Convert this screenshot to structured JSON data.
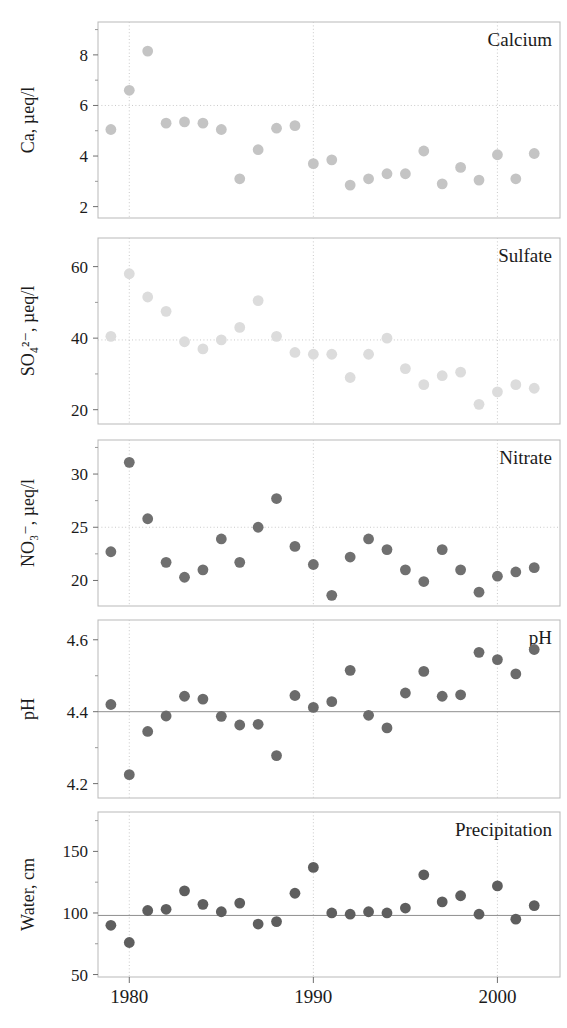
{
  "figure": {
    "width": 567,
    "height": 1028,
    "background": "#ffffff",
    "x_axis": {
      "tick_values": [
        1980,
        1990,
        2000
      ],
      "tick_labels": [
        "1980",
        "1990",
        "2000"
      ],
      "range": [
        1978.3,
        2003.4
      ],
      "gridlines": true
    },
    "colors": {
      "calcium_marker": "#c4c4c4",
      "sulfate_marker": "#dcdcdc",
      "nitrate_marker": "#707070",
      "ph_marker": "#6b6b6b",
      "water_marker": "#5e5e5e",
      "gridline_dotted": "#c9c9c9",
      "gridline_solid": "#8e8e8e",
      "frame": "#b9b9b9",
      "text": "#1b1b1b"
    }
  },
  "chart_data": [
    {
      "type": "scatter",
      "title": "Calcium",
      "xlabel": "",
      "ylabel": "Ca, µeq/l",
      "xlim": [
        1978.3,
        2003.4
      ],
      "ylim": [
        1.55,
        9.3
      ],
      "yticks": [
        2,
        4,
        6,
        8
      ],
      "ytick_labels": [
        "2",
        "4",
        "6",
        "8"
      ],
      "yminor_ticks": [
        3,
        5,
        7,
        9
      ],
      "gridlines_y": [
        6
      ],
      "grid": true,
      "marker_color": "#c4c4c4",
      "x": [
        1979,
        1980,
        1981,
        1982,
        1983,
        1984,
        1985,
        1986,
        1987,
        1988,
        1989,
        1990,
        1991,
        1992,
        1993,
        1994,
        1995,
        1996,
        1997,
        1998,
        1999,
        2000,
        2001,
        2002
      ],
      "values": [
        5.05,
        6.6,
        8.15,
        5.3,
        5.35,
        5.3,
        5.05,
        3.1,
        4.25,
        5.1,
        5.2,
        3.7,
        3.85,
        2.85,
        3.1,
        3.3,
        3.3,
        4.2,
        2.9,
        3.55,
        3.05,
        4.05,
        3.1,
        4.1
      ]
    },
    {
      "type": "scatter",
      "title": "Sulfate",
      "xlabel": "",
      "ylabel": "SO₄²⁻, µeq/l",
      "xlim": [
        1978.3,
        2003.4
      ],
      "ylim": [
        16,
        68
      ],
      "yticks": [
        20,
        40,
        60
      ],
      "ytick_labels": [
        "20",
        "40",
        "60"
      ],
      "yminor_ticks": [
        30,
        50
      ],
      "gridlines_y": [
        39.5
      ],
      "grid": true,
      "marker_color": "#dcdcdc",
      "x": [
        1979,
        1980,
        1981,
        1982,
        1983,
        1984,
        1985,
        1986,
        1987,
        1988,
        1989,
        1990,
        1991,
        1992,
        1993,
        1994,
        1995,
        1996,
        1997,
        1998,
        1999,
        2000,
        2001,
        2002
      ],
      "values": [
        40.5,
        58,
        51.5,
        47.5,
        39,
        37,
        39.5,
        43,
        50.5,
        40.5,
        36,
        35.5,
        35.5,
        29,
        35.5,
        40,
        31.5,
        27,
        29.5,
        30.5,
        21.5,
        25,
        27,
        26
      ]
    },
    {
      "type": "scatter",
      "title": "Nitrate",
      "xlabel": "",
      "ylabel": "NO₃⁻, µeq/l",
      "xlim": [
        1978.3,
        2003.4
      ],
      "ylim": [
        17.6,
        33.2
      ],
      "yticks": [
        20,
        25,
        30
      ],
      "ytick_labels": [
        "20",
        "25",
        "30"
      ],
      "yminor_ticks": [
        22.5,
        27.5,
        32.5
      ],
      "gridlines_y": [
        25
      ],
      "grid": true,
      "marker_color": "#707070",
      "x": [
        1979,
        1980,
        1981,
        1982,
        1983,
        1984,
        1985,
        1986,
        1987,
        1988,
        1989,
        1990,
        1991,
        1992,
        1993,
        1994,
        1995,
        1996,
        1997,
        1998,
        1999,
        2000,
        2001,
        2002
      ],
      "values": [
        22.7,
        31.1,
        25.8,
        21.7,
        20.3,
        21.0,
        23.9,
        21.7,
        25.0,
        27.7,
        23.2,
        21.5,
        18.6,
        22.2,
        23.9,
        22.9,
        21.0,
        19.9,
        22.9,
        21.0,
        18.9,
        20.4,
        20.8,
        21.2
      ]
    },
    {
      "type": "scatter",
      "title": "pH",
      "xlabel": "",
      "ylabel": "pH",
      "xlim": [
        1978.3,
        2003.4
      ],
      "ylim": [
        4.16,
        4.655
      ],
      "yticks": [
        4.2,
        4.4,
        4.6
      ],
      "ytick_labels": [
        "4.2",
        "4.4",
        "4.6"
      ],
      "yminor_ticks": [
        4.3,
        4.5
      ],
      "gridlines_y": [
        4.4
      ],
      "gridline_style": "solid",
      "grid": true,
      "marker_color": "#6b6b6b",
      "x": [
        1979,
        1980,
        1981,
        1982,
        1983,
        1984,
        1985,
        1986,
        1987,
        1988,
        1989,
        1990,
        1991,
        1992,
        1993,
        1994,
        1995,
        1996,
        1997,
        1998,
        1999,
        2000,
        2001,
        2002
      ],
      "values": [
        4.42,
        4.225,
        4.345,
        4.388,
        4.443,
        4.435,
        4.387,
        4.363,
        4.365,
        4.278,
        4.445,
        4.412,
        4.428,
        4.515,
        4.39,
        4.355,
        4.452,
        4.512,
        4.443,
        4.447,
        4.565,
        4.545,
        4.505,
        4.573
      ]
    },
    {
      "type": "scatter",
      "title": "Precipitation",
      "xlabel": "",
      "ylabel": "Water, cm",
      "xlim": [
        1978.3,
        2003.4
      ],
      "ylim": [
        48,
        182
      ],
      "yticks": [
        50,
        100,
        150
      ],
      "ytick_labels": [
        "50",
        "100",
        "150"
      ],
      "yminor_ticks": [
        75,
        125,
        175
      ],
      "gridlines_y": [
        98
      ],
      "gridline_style": "solid",
      "grid": true,
      "marker_color": "#5e5e5e",
      "x": [
        1979,
        1980,
        1981,
        1982,
        1983,
        1984,
        1985,
        1986,
        1987,
        1988,
        1989,
        1990,
        1991,
        1992,
        1993,
        1994,
        1995,
        1996,
        1997,
        1998,
        1999,
        2000,
        2001,
        2002
      ],
      "values": [
        90,
        76,
        102,
        103,
        118,
        107,
        101,
        108,
        91,
        93,
        116,
        137,
        100,
        99,
        101,
        100,
        104,
        131,
        109,
        114,
        99,
        122,
        95,
        106
      ]
    }
  ]
}
